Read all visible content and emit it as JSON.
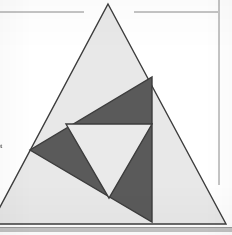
{
  "page": {
    "width": 232,
    "height": 235,
    "background": "#ffffff"
  },
  "colors": {
    "page_background": "#ffffff",
    "outer_triangle_fill": "#e8e8e8",
    "inner_triangle_fill": "#5a5a5a",
    "innermost_triangle_fill": "#eaeaea",
    "stroke": "#3c3c3c",
    "rule_line": "#8a8a8a",
    "bottom_band": "#b9b9b9"
  },
  "figure": {
    "name": "nested-triangles",
    "outer_triangle": {
      "label": "outer-triangle",
      "fill": "#e8e8e8",
      "stroke": "#3c3c3c",
      "stroke_width": 1.4,
      "points": "108,4 226,224 -9,224"
    },
    "inner_triangle": {
      "label": "inner-dark-triangle",
      "fill": "#5a5a5a",
      "stroke": "#3c3c3c",
      "stroke_width": 1.4,
      "points": "152,77 152,222 30,150"
    },
    "innermost_triangle": {
      "label": "innermost-light-triangle",
      "fill": "#eaeaea",
      "stroke": "#3c3c3c",
      "stroke_width": 1.4,
      "points": "66,124 152,124 109,198"
    },
    "vertices": [
      {
        "name": "outer-apex",
        "x": 108,
        "y": 4
      },
      {
        "name": "outer-bottom-left",
        "x": -9,
        "y": 224
      },
      {
        "name": "outer-bottom-right",
        "x": 226,
        "y": 224
      },
      {
        "name": "inner-top",
        "x": 152,
        "y": 77
      },
      {
        "name": "inner-left",
        "x": 30,
        "y": 150
      },
      {
        "name": "inner-bottom-right",
        "x": 152,
        "y": 222
      },
      {
        "name": "innermost-top-left",
        "x": 66,
        "y": 124
      },
      {
        "name": "innermost-top-right",
        "x": 152,
        "y": 124
      },
      {
        "name": "innermost-bottom",
        "x": 109,
        "y": 198
      }
    ]
  },
  "page_marks": {
    "rule_top_left": {
      "x1": 0,
      "y1": 12,
      "x2": 84,
      "y2": 12,
      "color": "#8a8a8a"
    },
    "rule_top_right": {
      "x1": 134,
      "y1": 12,
      "x2": 218,
      "y2": 12,
      "color": "#8a8a8a"
    },
    "rule_right_vertical": {
      "x1": 219,
      "y1": 0,
      "x2": 219,
      "y2": 185,
      "color": "#8a8a8a"
    },
    "bottom_band": {
      "x": 0,
      "y": 228,
      "width": 232,
      "height": 4,
      "color": "#b9b9b9"
    },
    "left_clipped_text": "t"
  }
}
